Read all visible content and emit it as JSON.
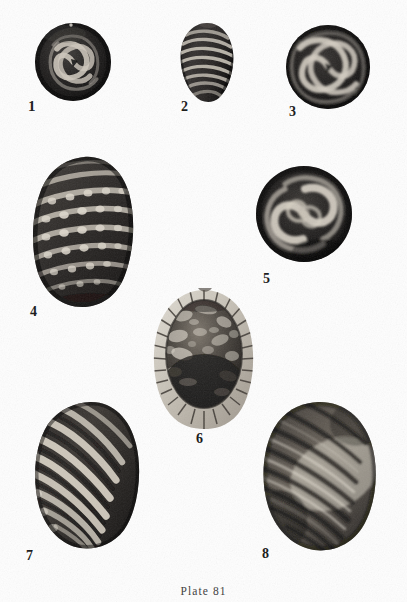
{
  "plate": {
    "caption": "Plate  81",
    "caption_plain": "Plate 81",
    "plate_number": "81",
    "background_color": "#fefefe",
    "ink_color": "#151515",
    "width": 407,
    "height": 602,
    "medium": "halftone photographic plate",
    "subject": "fossil foraminifera specimens",
    "figure_count": 8
  },
  "figures": [
    {
      "number": "1",
      "label_x": 28,
      "label_y": 99,
      "shape": "circular",
      "pattern": "involute labyrinthine spiral, light ribs on dark ground",
      "center_x": 72,
      "center_y": 62,
      "radius_x": 38,
      "radius_y": 40,
      "tone": "very dark"
    },
    {
      "number": "2",
      "label_x": 181,
      "label_y": 100,
      "shape": "ovate",
      "pattern": "transverse light costae, equatorial rows",
      "center_x": 206,
      "center_y": 62,
      "radius_x": 30,
      "radius_y": 40,
      "tone": "dark"
    },
    {
      "number": "3",
      "label_x": 289,
      "label_y": 105,
      "shape": "circular",
      "pattern": "bold light spiral whorls, planispiral coil",
      "center_x": 327,
      "center_y": 66,
      "radius_x": 42,
      "radius_y": 42,
      "tone": "dark"
    },
    {
      "number": "4",
      "label_x": 30,
      "label_y": 305,
      "shape": "broad ovate",
      "pattern": "oblique costae with rows of beads / pustules",
      "center_x": 83,
      "center_y": 231,
      "radius_x": 53,
      "radius_y": 76,
      "tone": "mid dark"
    },
    {
      "number": "5",
      "label_x": 263,
      "label_y": 272,
      "shape": "circular",
      "pattern": "pinwheel spiral, four bold light arms",
      "center_x": 303,
      "center_y": 213,
      "radius_x": 48,
      "radius_y": 48,
      "tone": "dark"
    },
    {
      "number": "6",
      "label_x": 196,
      "label_y": 432,
      "shape": "ovate section",
      "pattern": "light radial chambered rim, mottled recrystallised interior",
      "center_x": 204,
      "center_y": 357,
      "radius_x": 55,
      "radius_y": 70,
      "tone": "light rim, dark core"
    },
    {
      "number": "7",
      "label_x": 26,
      "label_y": 549,
      "shape": "elongate ovate",
      "pattern": "strong oblique light costae",
      "center_x": 86,
      "center_y": 474,
      "radius_x": 57,
      "radius_y": 75,
      "tone": "high contrast"
    },
    {
      "number": "8",
      "label_x": 262,
      "label_y": 547,
      "shape": "broad ovate",
      "pattern": "oblique costae with broad bright highlight band",
      "center_x": 318,
      "center_y": 477,
      "radius_x": 62,
      "radius_y": 76,
      "tone": "mid grey with highlight"
    }
  ],
  "font_sizes": {
    "figure_number": "15px",
    "figure_number_small": "13px",
    "caption": "11.5px"
  }
}
